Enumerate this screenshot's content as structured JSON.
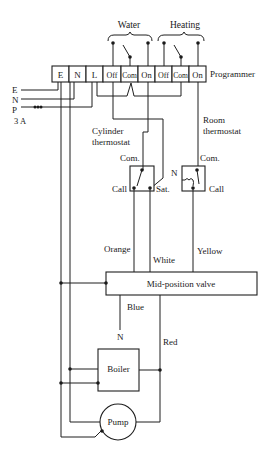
{
  "diagram": {
    "type": "wiring-diagram",
    "groups": {
      "water": "Water",
      "heating": "Heating"
    },
    "programmer": {
      "label": "Programmer",
      "terminals": [
        "E",
        "N",
        "L",
        "Off",
        "Com",
        "On",
        "Off",
        "Com",
        "On"
      ]
    },
    "supply": {
      "e": "E",
      "n": "N",
      "p": "P",
      "fuse": "3 A"
    },
    "cylinder_thermostat": {
      "label_line1": "Cylinder",
      "label_line2": "thermostat",
      "com": "Com.",
      "call": "Call",
      "sat": "Sat."
    },
    "room_thermostat": {
      "label_line1": "Room",
      "label_line2": "thermostat",
      "com": "Com.",
      "call": "Call",
      "n": "N"
    },
    "wires": {
      "orange": "Orange",
      "white": "White",
      "yellow": "Yellow",
      "blue": "Blue",
      "red": "Red"
    },
    "valve": {
      "label": "Mid-position valve"
    },
    "blue_end": "N",
    "boiler": {
      "label": "Boiler"
    },
    "pump": {
      "label": "Pump"
    }
  }
}
